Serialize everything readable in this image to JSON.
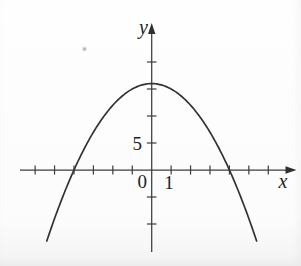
{
  "figure": {
    "background": "#fdfdfd",
    "axis_color": "#3d3d3d",
    "curve_color": "#333333",
    "text_color": "#242424"
  },
  "chart_data": {
    "type": "line",
    "title": "",
    "xlabel": "x",
    "ylabel": "y",
    "origin_label": "0",
    "grid": false,
    "legend": false,
    "xlim": [
      -6.8,
      7.4
    ],
    "ylim": [
      -15.2,
      27.2
    ],
    "x_ticks": [
      -6,
      -5,
      -4,
      -3,
      -2,
      -1,
      1,
      2,
      3,
      4,
      5,
      6
    ],
    "labeled_x_tick": {
      "value": 1,
      "label": "1"
    },
    "y_ticks": [
      -10,
      -5,
      5,
      10,
      15,
      20
    ],
    "labeled_y_tick": {
      "value": 5,
      "label": "5"
    },
    "curve": {
      "kind": "parabola",
      "equation": "y = 16 - x^2",
      "a": -1,
      "vertex": [
        0,
        16
      ],
      "x_intercepts": [
        -4,
        4
      ],
      "y_intercept": 16,
      "x_domain_drawn": [
        -5.4,
        5.4
      ],
      "points": [
        [
          -5,
          -9
        ],
        [
          -4,
          0
        ],
        [
          -3,
          7
        ],
        [
          -2,
          12
        ],
        [
          -1,
          15
        ],
        [
          0,
          16
        ],
        [
          1,
          15
        ],
        [
          2,
          12
        ],
        [
          3,
          7
        ],
        [
          4,
          0
        ],
        [
          5,
          -9
        ]
      ]
    }
  }
}
